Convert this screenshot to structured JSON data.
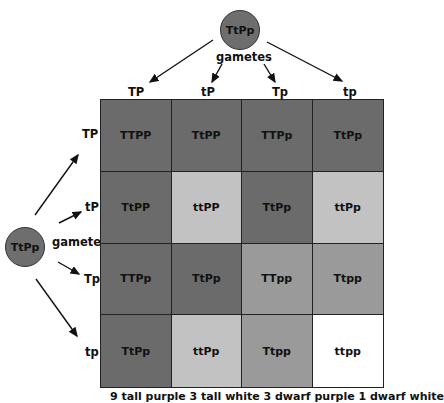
{
  "top_parent": {
    "genotype": "TtPp",
    "gametes_label": "gametes"
  },
  "left_parent": {
    "genotype": "TtPp",
    "gametes_label": "gametes"
  },
  "column_gametes": [
    "TP",
    "tP",
    "Tp",
    "tp"
  ],
  "row_gametes": [
    "TP",
    "tP",
    "Tp",
    "tp"
  ],
  "colors": {
    "tall_purple": "#6b6b6b",
    "tall_white": "#9a9a9a",
    "dwarf_purple": "#c2c2c2",
    "dwarf_white": "#ffffff",
    "parent_circle": "#6e6e6e"
  },
  "grid": [
    [
      {
        "genotype": "TTPP",
        "phenotype": "tall_purple"
      },
      {
        "genotype": "TtPP",
        "phenotype": "tall_purple"
      },
      {
        "genotype": "TTPp",
        "phenotype": "tall_purple"
      },
      {
        "genotype": "TtPp",
        "phenotype": "tall_purple"
      }
    ],
    [
      {
        "genotype": "TtPP",
        "phenotype": "tall_purple"
      },
      {
        "genotype": "ttPP",
        "phenotype": "dwarf_purple"
      },
      {
        "genotype": "TtPp",
        "phenotype": "tall_purple"
      },
      {
        "genotype": "ttPp",
        "phenotype": "dwarf_purple"
      }
    ],
    [
      {
        "genotype": "TTPp",
        "phenotype": "tall_purple"
      },
      {
        "genotype": "TtPp",
        "phenotype": "tall_purple"
      },
      {
        "genotype": "TTpp",
        "phenotype": "tall_white"
      },
      {
        "genotype": "Ttpp",
        "phenotype": "tall_white"
      }
    ],
    [
      {
        "genotype": "TtPp",
        "phenotype": "tall_purple"
      },
      {
        "genotype": "ttPp",
        "phenotype": "dwarf_purple"
      },
      {
        "genotype": "Ttpp",
        "phenotype": "tall_white"
      },
      {
        "genotype": "ttpp",
        "phenotype": "dwarf_white"
      }
    ]
  ],
  "caption": "9 tall purple 3 tall white 3 dwarf purple 1 dwarf white"
}
